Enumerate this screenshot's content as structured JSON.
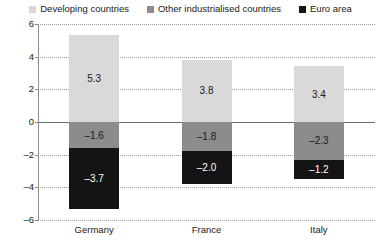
{
  "chart_data": {
    "type": "bar",
    "subtype": "stacked-bar",
    "title": "",
    "xlabel": "",
    "ylabel": "",
    "categories": [
      "Germany",
      "France",
      "Italy"
    ],
    "series": [
      {
        "name": "Developing countries",
        "color": "#d9d9d9",
        "label_color": "#1a1a1a",
        "values": [
          5.3,
          3.8,
          3.4
        ],
        "value_labels": [
          "5.3",
          "3.8",
          "3.4"
        ]
      },
      {
        "name": "Other industrialised countries",
        "color": "#8c8c8c",
        "label_color": "#1a1a1a",
        "values": [
          -1.6,
          -1.8,
          -2.3
        ],
        "value_labels": [
          "–1.6",
          "–1.8",
          "–2.3"
        ]
      },
      {
        "name": "Euro area",
        "color": "#141414",
        "label_color": "#ffffff",
        "values": [
          -3.7,
          -2.0,
          -1.2
        ],
        "value_labels": [
          "–3.7",
          "–2.0",
          "–1.2"
        ]
      }
    ],
    "ylim": [
      -6,
      6
    ],
    "yticks": [
      6,
      4,
      2,
      0,
      -2,
      -4,
      -6
    ],
    "ytick_labels": [
      "6",
      "4",
      "2",
      "0",
      "–2",
      "–4",
      "–6"
    ],
    "grid": true,
    "gridstyle": "dotted",
    "zero_line": true,
    "legend_position": "top"
  },
  "legend": {
    "items": [
      {
        "label": "Developing countries",
        "color": "#d9d9d9"
      },
      {
        "label": "Other industrialised countries",
        "color": "#8c8c8c"
      },
      {
        "label": "Euro area",
        "color": "#141414"
      }
    ]
  },
  "axis": {
    "y_tick_labels": [
      "6",
      "4",
      "2",
      "0",
      "–2",
      "–4",
      "–6"
    ],
    "x_tick_labels": [
      "Germany",
      "France",
      "Italy"
    ]
  }
}
